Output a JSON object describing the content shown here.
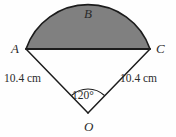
{
  "figure": {
    "type": "circular-sector-with-shaded-segment",
    "points": {
      "A": "A",
      "B": "B",
      "C": "C",
      "O": "O"
    },
    "dimensions": {
      "radius_left": "10.4 cm",
      "radius_right": "10.4 cm"
    },
    "angle": {
      "value": "120°"
    },
    "colors": {
      "shading": "#808080",
      "stroke": "#1c1c1c",
      "background": "#fefefe"
    }
  }
}
